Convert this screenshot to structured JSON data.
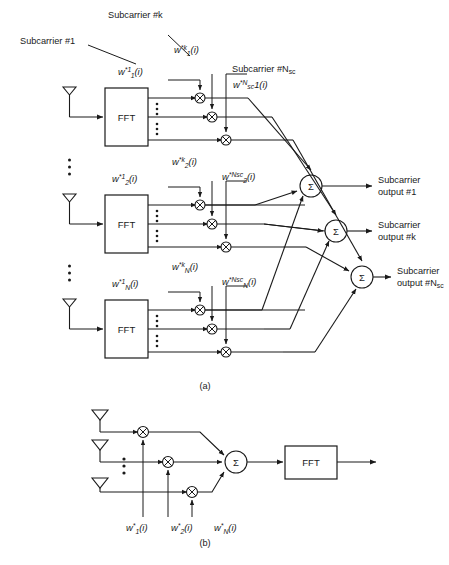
{
  "figure": {
    "captions": {
      "panel_a": "(a)",
      "panel_b": "(b)"
    },
    "annotations": {
      "subcarrier_1": "Subcarrier #1",
      "subcarrier_k": "Subcarrier #k",
      "subcarrier_nsc": "Subcarrier #N",
      "subcarrier_nsc_sub": "sc"
    },
    "blocks": {
      "fft_label": "FFT",
      "sum_label": "Σ"
    },
    "panel_a": {
      "rows": [
        {
          "id": "row-1",
          "antenna": "antenna-1",
          "weights": [
            {
              "id": "w-1-1",
              "base": "w",
              "sup": "*1",
              "sub": "1",
              "arg": "(i)"
            },
            {
              "id": "w-k-1",
              "base": "w",
              "sup": "*k",
              "sub": "1",
              "arg": "(i)"
            },
            {
              "id": "w-nsc-1",
              "base": "w",
              "sup": "*N",
              "supsub": "sc",
              "sub": "1",
              "arg": "(i)"
            }
          ]
        },
        {
          "id": "row-2",
          "antenna": "antenna-2",
          "weights": [
            {
              "id": "w-1-2",
              "base": "w",
              "sup": "*1",
              "sub": "2",
              "arg": "(i)"
            },
            {
              "id": "w-k-2",
              "base": "w",
              "sup": "*k",
              "sub": "2",
              "arg": "(i)"
            },
            {
              "id": "w-nsc-2",
              "base": "w",
              "sup": "*N",
              "supsub": "sc",
              "sub": "2",
              "arg": "(i)"
            }
          ]
        },
        {
          "id": "row-N",
          "antenna": "antenna-N",
          "weights": [
            {
              "id": "w-1-N",
              "base": "w",
              "sup": "*1",
              "sub": "N",
              "arg": "(i)"
            },
            {
              "id": "w-k-N",
              "base": "w",
              "sup": "*k",
              "sub": "N",
              "arg": "(i)"
            },
            {
              "id": "w-nsc-N",
              "base": "w",
              "sup": "*N",
              "supsub": "sc",
              "sub": "N",
              "arg": "(i)"
            }
          ]
        }
      ],
      "outputs": [
        {
          "id": "out-1",
          "line1": "Subcarrier",
          "line2": "output #1",
          "line2_sub": ""
        },
        {
          "id": "out-k",
          "line1": "Subcarrier",
          "line2": "output #k",
          "line2_sub": ""
        },
        {
          "id": "out-nsc",
          "line1": "Subcarrier",
          "line2": "output #N",
          "line2_sub": "sc"
        }
      ]
    },
    "panel_b": {
      "antennas": [
        "antenna-1",
        "antenna-2",
        "antenna-N"
      ],
      "weights": [
        {
          "id": "wb-1",
          "base": "w",
          "sup": "*",
          "sub": "1",
          "arg": "(i)"
        },
        {
          "id": "wb-2",
          "base": "w",
          "sup": "*",
          "sub": "2",
          "arg": "(i)"
        },
        {
          "id": "wb-N",
          "base": "w",
          "sup": "*",
          "sub": "N",
          "arg": "(i)"
        }
      ],
      "fft_label": "FFT",
      "sum_label": "Σ"
    },
    "colors": {
      "ink": "#1a1a1a",
      "paper": "#ffffff"
    }
  }
}
